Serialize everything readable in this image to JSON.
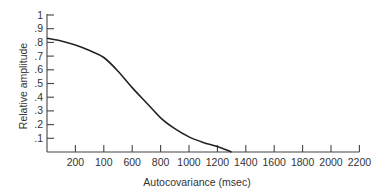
{
  "chart_data": {
    "type": "line",
    "title": "",
    "xlabel": "Autocovariance (msec)",
    "ylabel": "Relative amplitude",
    "x_tick_labels": [
      "200",
      "100",
      "600",
      "800",
      "1000",
      "1200",
      "1400",
      "1600",
      "1800",
      "2000",
      "2200"
    ],
    "y_tick_labels": [
      ".1",
      ".2",
      ".3",
      ".4",
      ".5",
      ".6",
      ".7",
      ".8",
      ".9",
      "1"
    ],
    "y_tick_values": [
      0.1,
      0.2,
      0.3,
      0.4,
      0.5,
      0.6,
      0.7,
      0.8,
      0.9,
      1.0
    ],
    "ylim": [
      0,
      1
    ],
    "xlim_ticks": [
      0,
      11
    ],
    "grid": false,
    "legend": null,
    "series": [
      {
        "name": "Relative amplitude",
        "x_tick_positions": [
          0,
          0.5,
          1,
          1.5,
          2,
          2.5,
          3,
          3.5,
          4,
          4.5,
          5,
          5.5,
          6,
          6.5
        ],
        "values": [
          0.83,
          0.81,
          0.78,
          0.74,
          0.69,
          0.59,
          0.47,
          0.36,
          0.25,
          0.17,
          0.11,
          0.07,
          0.04,
          0.0
        ]
      }
    ]
  }
}
